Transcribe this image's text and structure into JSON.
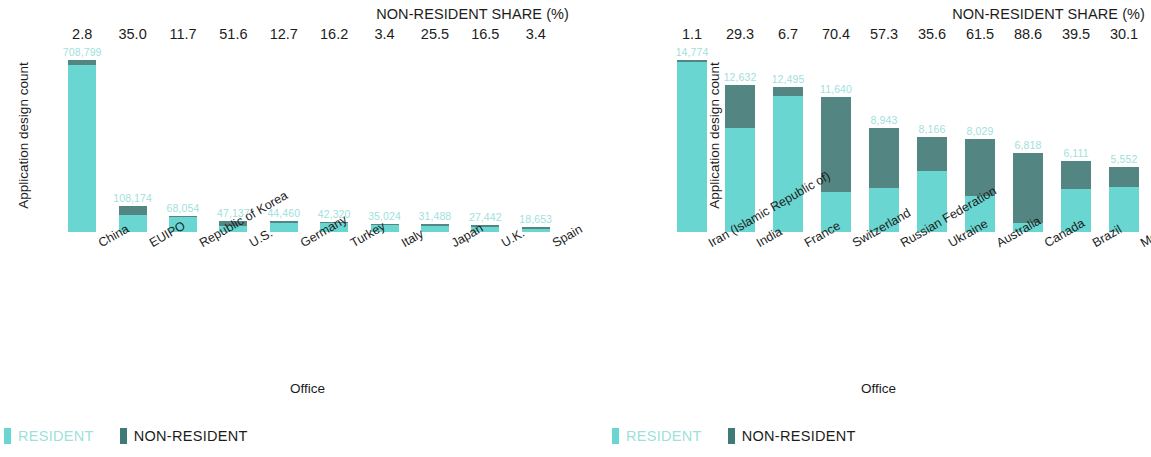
{
  "charts": [
    {
      "id": "left",
      "ylabel": "Application design count",
      "xlabel": "Office",
      "share_title": "NON-RESIDENT SHARE (%)",
      "legend": {
        "resident": "RESIDENT",
        "non_resident": "NON-RESIDENT"
      }
    },
    {
      "id": "right",
      "ylabel": "Application design count",
      "xlabel": "Office",
      "share_title": "NON-RESIDENT SHARE (%)",
      "legend": {
        "resident": "RESIDENT",
        "non_resident": "NON-RESIDENT"
      }
    }
  ],
  "colors": {
    "resident": "#6ad6d1",
    "non_resident": "#538683",
    "value_label": "#9fdfdc",
    "text": "#1c1c1c"
  },
  "chart_data": [
    {
      "type": "bar",
      "stacked": true,
      "title": "",
      "xlabel": "Office",
      "ylabel": "Application design count",
      "annotation_title": "NON-RESIDENT SHARE (%)",
      "grid": false,
      "legend": [
        "RESIDENT",
        "NON-RESIDENT"
      ],
      "legend_position": "bottom-left",
      "ylim": [
        0,
        708799
      ],
      "categories": [
        "China",
        "EUIPO",
        "Republic of Korea",
        "U.S.",
        "Germany",
        "Turkey",
        "Italy",
        "Japan",
        "U.K.",
        "Spain"
      ],
      "totals": [
        708799,
        108174,
        68054,
        47137,
        44460,
        42320,
        35024,
        31488,
        27442,
        18653
      ],
      "total_labels": [
        "708,799",
        "108,174",
        "68,054",
        "47,137",
        "44,460",
        "42,320",
        "35,024",
        "31,488",
        "27,442",
        "18,653"
      ],
      "non_resident_share_pct": [
        2.8,
        35.0,
        11.7,
        51.6,
        12.7,
        16.2,
        3.4,
        25.5,
        16.5,
        3.4
      ],
      "share_labels": [
        "2.8",
        "35.0",
        "11.7",
        "51.6",
        "12.7",
        "16.2",
        "3.4",
        "25.5",
        "16.5",
        "3.4"
      ],
      "series": [
        {
          "name": "RESIDENT",
          "values": [
            688953,
            70313,
            60092,
            22814,
            38814,
            35464,
            33833,
            23459,
            22914,
            18019
          ]
        },
        {
          "name": "NON-RESIDENT",
          "values": [
            19846,
            37861,
            7962,
            24323,
            5646,
            6856,
            1191,
            8029,
            4528,
            634
          ]
        }
      ]
    },
    {
      "type": "bar",
      "stacked": true,
      "title": "",
      "xlabel": "Office",
      "ylabel": "Application design count",
      "annotation_title": "NON-RESIDENT SHARE (%)",
      "grid": false,
      "legend": [
        "RESIDENT",
        "NON-RESIDENT"
      ],
      "legend_position": "bottom-left",
      "ylim": [
        0,
        14774
      ],
      "categories": [
        "Iran (Islamic Republic of)",
        "India",
        "France",
        "Switzerland",
        "Russian Federation",
        "Ukraine",
        "Australia",
        "Canada",
        "Brazil",
        "Morocco"
      ],
      "totals": [
        14774,
        12632,
        12495,
        11640,
        8943,
        8166,
        8029,
        6818,
        6111,
        5552
      ],
      "total_labels": [
        "14,774",
        "12,632",
        "12,495",
        "11,640",
        "8,943",
        "8,166",
        "8,029",
        "6,818",
        "6,111",
        "5,552"
      ],
      "non_resident_share_pct": [
        1.1,
        29.3,
        6.7,
        70.4,
        57.3,
        35.6,
        61.5,
        88.6,
        39.5,
        30.1
      ],
      "share_labels": [
        "1.1",
        "29.3",
        "6.7",
        "70.4",
        "57.3",
        "35.6",
        "61.5",
        "88.6",
        "39.5",
        "30.1"
      ],
      "series": [
        {
          "name": "RESIDENT",
          "values": [
            14611,
            8931,
            11658,
            3445,
            3819,
            5259,
            3091,
            777,
            3697,
            3881
          ]
        },
        {
          "name": "NON-RESIDENT",
          "values": [
            163,
            3701,
            837,
            8195,
            5124,
            2907,
            4938,
            6041,
            2414,
            1671
          ]
        }
      ]
    }
  ]
}
